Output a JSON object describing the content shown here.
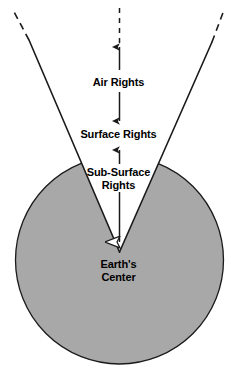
{
  "diagram": {
    "colors": {
      "earth_fill": "#a8a8a8",
      "stroke": "#1a1a1a",
      "background": "#ffffff",
      "text": "#000000"
    },
    "labels": {
      "air_rights": "Air Rights",
      "surface_rights": "Surface Rights",
      "sub_surface_rights": "Sub-Surface\nRights",
      "earths_center": "Earth's\nCenter"
    },
    "shapes": {
      "earth_circle": {
        "name": "earth-sphere",
        "cx": 119.5,
        "cy": 260,
        "r": 104
      },
      "wedge": {
        "name": "property-rights-wedge",
        "apex_x": 119.5,
        "apex_y": 252,
        "left_top_x": 29,
        "left_top_y": 40,
        "right_top_x": 212,
        "right_top_y": 42
      },
      "dashed_left": {
        "x1": 13,
        "y1": 10,
        "x2": 29,
        "y2": 40
      },
      "dashed_right": {
        "x1": 224,
        "y1": 10,
        "x2": 212,
        "y2": 42
      },
      "dashed_center": {
        "x1": 119.5,
        "y1": 8,
        "x2": 119.5,
        "y2": 40
      }
    },
    "arrows": {
      "air_rights_up": {
        "x": 119.5,
        "y_from": 70,
        "y_to": 43
      },
      "air_rights_down": {
        "x": 119.5,
        "y_from": 92,
        "y_to": 125
      },
      "sub_surface_up": {
        "x": 119.5,
        "y_from": 166,
        "y_to": 147
      },
      "earths_center_down": {
        "x": 119.5,
        "y_from": 176,
        "y_to": 252
      }
    }
  }
}
